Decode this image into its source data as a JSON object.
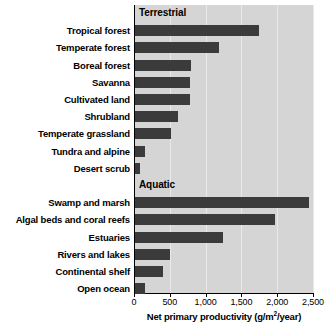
{
  "chart_data": {
    "type": "bar",
    "orientation": "horizontal",
    "title": "",
    "xlabel": "Net primary productivity (g/m2/year)",
    "xlabel_display": "Net primary productivity (g/m",
    "xlabel_sup": "2",
    "xlabel_tail": "/year)",
    "ylabel": "",
    "xlim": [
      0,
      2500
    ],
    "grid": true,
    "grid_axis": "x",
    "legend": "none",
    "tick_labels": [
      "0",
      "500",
      "1,000",
      "1,500",
      "2,000",
      "2,500"
    ],
    "tick_values": [
      0,
      500,
      1000,
      1500,
      2000,
      2500
    ],
    "bar_color": "#3b3b3b",
    "plot_background": "#d5d5d5",
    "gridline_color": "#e9e9e9",
    "groups": [
      {
        "name": "Terrestrial",
        "categories": [
          "Tropical forest",
          "Temperate forest",
          "Boreal forest",
          "Savanna",
          "Cultivated land",
          "Shrubland",
          "Temperate grassland",
          "Tundra and alpine",
          "Desert scrub"
        ],
        "values": [
          1730,
          1180,
          780,
          770,
          770,
          600,
          500,
          140,
          70
        ]
      },
      {
        "name": "Aquatic",
        "categories": [
          "Swamp and marsh",
          "Algal beds and coral reefs",
          "Estuaries",
          "Rivers and lakes",
          "Continental shelf",
          "Open ocean"
        ],
        "values": [
          2430,
          1955,
          1230,
          490,
          390,
          140
        ]
      }
    ],
    "categories": [
      "Tropical forest",
      "Temperate forest",
      "Boreal forest",
      "Savanna",
      "Cultivated land",
      "Shrubland",
      "Temperate grassland",
      "Tundra and alpine",
      "Desert scrub",
      "Swamp and marsh",
      "Algal beds and coral reefs",
      "Estuaries",
      "Rivers and lakes",
      "Continental shelf",
      "Open ocean"
    ],
    "values": [
      1730,
      1180,
      780,
      770,
      770,
      600,
      500,
      140,
      70,
      2430,
      1955,
      1230,
      490,
      390,
      140
    ]
  }
}
